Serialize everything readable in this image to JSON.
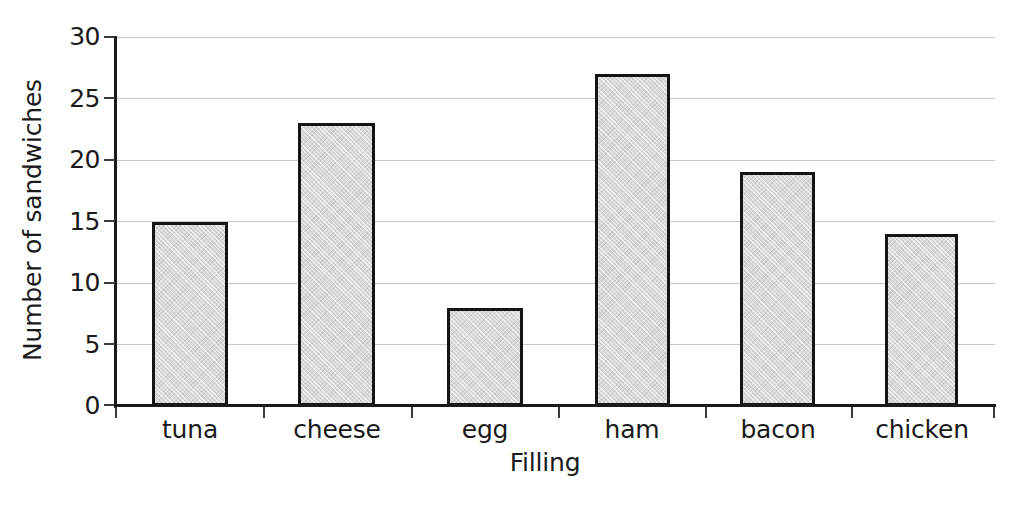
{
  "chart_data": {
    "type": "bar",
    "title": "",
    "subtitle": "",
    "xlabel": "Filling",
    "ylabel": "Number of sandwiches",
    "categories": [
      "tuna",
      "cheese",
      "egg",
      "ham",
      "bacon",
      "chicken"
    ],
    "values": [
      15,
      23,
      8,
      27,
      19,
      14
    ],
    "ylim": [
      0,
      30
    ],
    "ytick_labels": [
      "0",
      "5",
      "10",
      "15",
      "20",
      "25",
      "30"
    ],
    "ytick_values": [
      0,
      5,
      10,
      15,
      20,
      25,
      30
    ],
    "grid": "horizontal",
    "legend": "none",
    "bar_fill_color": "#d9d9d9",
    "bar_edge_color": "#151515",
    "axis_color": "#1a1a1a",
    "gridline_color": "#c9c9c9",
    "background_color": "#ffffff",
    "annotations": []
  }
}
